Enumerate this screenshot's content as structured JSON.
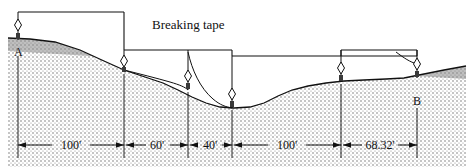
{
  "figure": {
    "annotation": {
      "text": "Breaking tape",
      "x": 152,
      "y": 29
    },
    "colors": {
      "ink": "#111111",
      "ground_fill": "#9a9a9a",
      "background": "#ffffff"
    },
    "points": [
      {
        "id": "A",
        "label": "A",
        "x": 18,
        "y": 52
      },
      {
        "id": "B",
        "label": "B",
        "x": 417,
        "y": 101
      }
    ],
    "plumb_bobs": [
      {
        "name": "plumb-bob-a",
        "x": 18,
        "tape_y": 12,
        "ground_y": 40
      },
      {
        "name": "plumb-bob-sta-100",
        "x": 124,
        "tape_y": 12,
        "ground_y": 70
      },
      {
        "name": "plumb-bob-sta-160",
        "x": 188,
        "tape_y": 50,
        "ground_y": 79
      },
      {
        "name": "plumb-bob-sta-200",
        "x": 232,
        "tape_y": 50,
        "ground_y": 101
      },
      {
        "name": "plumb-bob-sta-300",
        "x": 341,
        "tape_y": 56,
        "ground_y": 82
      },
      {
        "name": "plumb-bob-b",
        "x": 417,
        "tape_y": 56,
        "ground_y": 78
      }
    ],
    "tape_segments": [
      {
        "name": "tape-span-100",
        "length_label": "100'",
        "x1": 18,
        "x2": 124,
        "y": 12
      },
      {
        "name": "tape-span-60",
        "length_label": "60'",
        "x1": 124,
        "x2": 188,
        "y": 50
      },
      {
        "name": "tape-span-40",
        "length_label": "40'",
        "x1": 188,
        "x2": 232,
        "y": 50
      },
      {
        "name": "tape-span-100-b",
        "length_label": "100'",
        "x1": 232,
        "x2": 341,
        "y": 56
      },
      {
        "name": "tape-span-68",
        "length_label": "68.32'",
        "x1": 341,
        "x2": 417,
        "y": 56
      }
    ],
    "dimensions": {
      "line_y": 145,
      "items": [
        {
          "name": "dimension-100-first",
          "label": "100'",
          "x1": 18,
          "x2": 124
        },
        {
          "name": "dimension-60",
          "label": "60'",
          "x1": 124,
          "x2": 188
        },
        {
          "name": "dimension-40",
          "label": "40'",
          "x1": 188,
          "x2": 232
        },
        {
          "name": "dimension-100-second",
          "label": "100'",
          "x1": 232,
          "x2": 341
        },
        {
          "name": "dimension-68-32",
          "label": "68.32'",
          "x1": 341,
          "x2": 417
        }
      ]
    },
    "ground_profile": "M 8 38 L 30 39 L 55 42 L 80 50 L 104 61 L 124 70 L 145 77 L 163 83 L 178 90 L 192 97 L 206 103 L 220 107 L 234 108 L 250 107 L 264 103 L 278 96 L 292 90 L 308 86 L 326 83 L 344 81 L 364 80 L 386 79 L 404 78 L 424 74 L 444 70 L 466 66",
    "slack_tape_curves": [
      "M 124 12 L 124 70",
      "M 188 50 C 184 62, 181 70, 178 79",
      "M 232 50 L 232 101"
    ]
  }
}
